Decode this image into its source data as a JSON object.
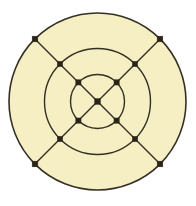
{
  "figure": {
    "canvas_width": 196,
    "canvas_height": 206,
    "background_color": "#FFFFFF"
  },
  "style": {
    "disc_fill": "#F5EFC3",
    "stroke_color": "#352F24",
    "outer_stroke_width": 1.6,
    "ring_stroke_width": 1.4,
    "spoke_stroke_width": 1.4,
    "node_fill": "#2B2418",
    "node_size": 5.2,
    "center_node_size": 5.6,
    "outer_node_size": 5.6
  },
  "geometry": {
    "center_x": 97.5,
    "center_y": 101.5,
    "outer_radius": 88.5,
    "middle_radius": 53.0,
    "inner_radius": 27.0,
    "spoke_angles_deg": [
      45,
      135,
      225,
      315
    ]
  },
  "circles": [
    {
      "name": "outer-circle",
      "radius": 88.5,
      "filled": true
    },
    {
      "name": "middle-circle",
      "radius": 53.0,
      "filled": false
    },
    {
      "name": "inner-circle",
      "radius": 27.0,
      "filled": false
    }
  ],
  "spokes": [
    {
      "name": "spoke-nw-se",
      "angle_deg": 135
    },
    {
      "name": "spoke-ne-sw",
      "angle_deg": 45
    }
  ],
  "nodes": [
    {
      "name": "node-center",
      "ring": "center",
      "x": 97.5,
      "y": 101.5
    },
    {
      "name": "node-inner-nw",
      "ring": "inner",
      "x": 78.4,
      "y": 82.4
    },
    {
      "name": "node-inner-ne",
      "ring": "inner",
      "x": 116.6,
      "y": 82.4
    },
    {
      "name": "node-inner-se",
      "ring": "inner",
      "x": 116.6,
      "y": 120.6
    },
    {
      "name": "node-inner-sw",
      "ring": "inner",
      "x": 78.4,
      "y": 120.6
    },
    {
      "name": "node-middle-nw",
      "ring": "middle",
      "x": 60.0,
      "y": 64.0
    },
    {
      "name": "node-middle-ne",
      "ring": "middle",
      "x": 135.0,
      "y": 64.0
    },
    {
      "name": "node-middle-se",
      "ring": "middle",
      "x": 135.0,
      "y": 139.0
    },
    {
      "name": "node-middle-sw",
      "ring": "middle",
      "x": 60.0,
      "y": 139.0
    },
    {
      "name": "node-outer-nw",
      "ring": "outer",
      "x": 35.0,
      "y": 39.0
    },
    {
      "name": "node-outer-ne",
      "ring": "outer",
      "x": 160.0,
      "y": 39.0
    },
    {
      "name": "node-outer-se",
      "ring": "outer",
      "x": 160.0,
      "y": 164.0
    },
    {
      "name": "node-outer-sw",
      "ring": "outer",
      "x": 35.0,
      "y": 164.0
    }
  ],
  "counts": {
    "total_nodes": 13,
    "total_circles": 3,
    "total_spokes": 2
  }
}
